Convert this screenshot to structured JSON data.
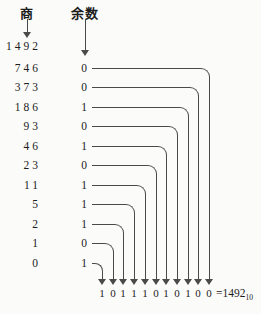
{
  "headers": {
    "quotient_label": "商",
    "remainder_label": "余数"
  },
  "quotients": [
    "1492",
    "746",
    "373",
    "186",
    "93",
    "46",
    "23",
    "11",
    "5",
    "2",
    "1",
    "0"
  ],
  "remainders": [
    "0",
    "0",
    "1",
    "0",
    "1",
    "0",
    "1",
    "1",
    "1",
    "0",
    "1"
  ],
  "result": {
    "bits": [
      "1",
      "0",
      "1",
      "1",
      "1",
      "0",
      "1",
      "0",
      "1",
      "0",
      "0"
    ],
    "equals": "=1492",
    "base_subscript": "10"
  },
  "colors": {
    "line": "#4a4a4a",
    "text": "#1c1c1c",
    "background": "#fbfbf9"
  }
}
